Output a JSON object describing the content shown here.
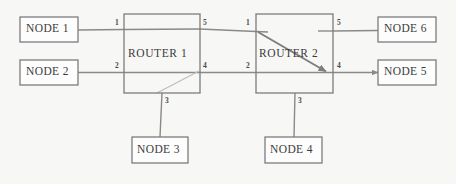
{
  "diagram": {
    "background_color": "#f7f7f6",
    "line_color": "#8a8a8a",
    "box_border_color": "#7d7d7d",
    "box_fill_color": "#fdfdfd",
    "text_color": "#3b3b3b",
    "nodes": [
      {
        "id": "node1",
        "label": "NODE 1",
        "x": 20,
        "y": 17,
        "w": 58,
        "h": 25
      },
      {
        "id": "node2",
        "label": "NODE 2",
        "x": 20,
        "y": 60,
        "w": 58,
        "h": 25
      },
      {
        "id": "router1",
        "label": "ROUTER 1",
        "x": 124,
        "y": 14,
        "w": 76,
        "h": 79
      },
      {
        "id": "router2",
        "label": "ROUTER 2",
        "x": 256,
        "y": 14,
        "w": 77,
        "h": 79
      },
      {
        "id": "node6",
        "label": "NODE 6",
        "x": 378,
        "y": 17,
        "w": 58,
        "h": 25
      },
      {
        "id": "node5",
        "label": "NODE 5",
        "x": 378,
        "y": 60,
        "w": 58,
        "h": 25
      },
      {
        "id": "node3",
        "label": "NODE 3",
        "x": 132,
        "y": 137,
        "w": 56,
        "h": 26
      },
      {
        "id": "node4",
        "label": "NODE 4",
        "x": 265,
        "y": 137,
        "w": 57,
        "h": 26
      }
    ],
    "port_labels": [
      {
        "id": "r1-p1",
        "text": "1",
        "x": 115,
        "y": 18
      },
      {
        "id": "r1-p2",
        "text": "2",
        "x": 115,
        "y": 61
      },
      {
        "id": "r1-p5",
        "text": "5",
        "x": 203,
        "y": 18
      },
      {
        "id": "r1-p4",
        "text": "4",
        "x": 203,
        "y": 61
      },
      {
        "id": "r1-p3",
        "text": "3",
        "x": 165,
        "y": 96
      },
      {
        "id": "r2-p1",
        "text": "1",
        "x": 246,
        "y": 18
      },
      {
        "id": "r2-p2",
        "text": "2",
        "x": 246,
        "y": 61
      },
      {
        "id": "r2-p5",
        "text": "5",
        "x": 337,
        "y": 18
      },
      {
        "id": "r2-p4",
        "text": "4",
        "x": 337,
        "y": 61
      },
      {
        "id": "r2-p3",
        "text": "3",
        "x": 298,
        "y": 96
      }
    ],
    "links": [
      {
        "id": "node1-router1",
        "from": "NODE 1",
        "to": "ROUTER 1 port 1",
        "arrow": false
      },
      {
        "id": "node2-router1",
        "from": "NODE 2",
        "to": "ROUTER 1 port 2",
        "arrow": false
      },
      {
        "id": "router1-router2-top",
        "from": "ROUTER 1 port 5",
        "to": "ROUTER 2 port 1",
        "arrow": false
      },
      {
        "id": "router1-router2-bottom",
        "from": "ROUTER 1 port 4",
        "to": "ROUTER 2 port 2",
        "arrow": false
      },
      {
        "id": "router1-node3",
        "from": "ROUTER 1 port 3",
        "to": "NODE 3",
        "arrow": false
      },
      {
        "id": "router2-node4",
        "from": "ROUTER 2 port 3",
        "to": "NODE 4",
        "arrow": false
      },
      {
        "id": "router2-node6",
        "from": "ROUTER 2 port 5",
        "to": "NODE 6",
        "arrow": false
      },
      {
        "id": "router2-node5",
        "from": "ROUTER 2 port 4",
        "to": "NODE 5",
        "arrow": true
      },
      {
        "id": "router2-internal-path",
        "from": "ROUTER 2 port 1",
        "to": "ROUTER 2 port 4",
        "arrow": true
      },
      {
        "id": "router1-internal-path",
        "from": "ROUTER 1 port 3",
        "to": "ROUTER 1 port 4",
        "arrow": false
      }
    ]
  }
}
